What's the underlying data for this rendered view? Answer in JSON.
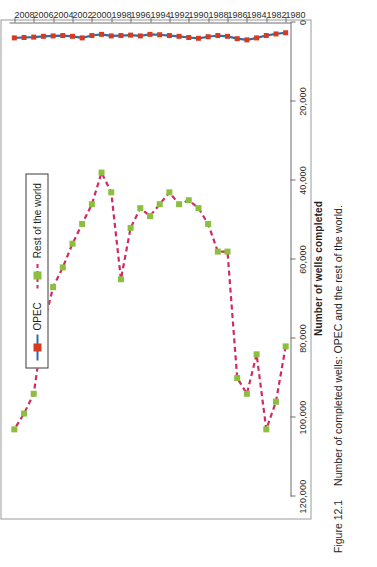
{
  "figure": {
    "number_label": "Figure 12.1",
    "caption": "Number of completed wells: OPEC and the rest of the world."
  },
  "legend": {
    "position": "upper-left-of-plot",
    "entries": [
      {
        "label": "OPEC",
        "line_color": "#2a6fa8",
        "marker_color": "#d83a20",
        "line_style": "solid"
      },
      {
        "label": "Rest of the world",
        "line_color": "#d12a63",
        "marker_color": "#8cbf3f",
        "line_style": "dashed"
      }
    ]
  },
  "chart_data": {
    "type": "line",
    "title": "",
    "subtitle": "",
    "xlabel": "",
    "ylabel": "Number of wells completed",
    "orientation": "rotated-90-ccw",
    "grid": false,
    "legend_position": "inside-upper-left",
    "xlim": [
      1979.5,
      2008.5
    ],
    "ylim": [
      0,
      120000
    ],
    "ytick_labels": [
      "0",
      "20,000",
      "40,000",
      "60,000",
      "80,000",
      "100,000",
      "120,000"
    ],
    "ytick_values": [
      0,
      20000,
      40000,
      60000,
      80000,
      100000,
      120000
    ],
    "xtick_labels": [
      "1980",
      "1982",
      "1984",
      "1986",
      "1988",
      "1990",
      "1992",
      "1994",
      "1996",
      "1998",
      "2000",
      "2002",
      "2004",
      "2006",
      "2008"
    ],
    "xtick_values": [
      1980,
      1982,
      1984,
      1986,
      1988,
      1990,
      1992,
      1994,
      1996,
      1998,
      2000,
      2002,
      2004,
      2006,
      2008
    ],
    "x": [
      1980,
      1981,
      1982,
      1983,
      1984,
      1985,
      1986,
      1987,
      1988,
      1989,
      1990,
      1991,
      1992,
      1993,
      1994,
      1995,
      1996,
      1997,
      1998,
      1999,
      2000,
      2001,
      2002,
      2003,
      2004,
      2005,
      2006,
      2007,
      2008
    ],
    "series": [
      {
        "name": "OPEC",
        "color": "#2a6fa8",
        "marker_color": "#d83a20",
        "line_style": "solid",
        "values": [
          2600,
          2900,
          3300,
          3900,
          4400,
          4100,
          3500,
          3300,
          3600,
          4000,
          3800,
          3500,
          3300,
          3100,
          3000,
          3400,
          3200,
          3300,
          3400,
          3000,
          3300,
          3900,
          3500,
          3300,
          3400,
          3500,
          3700,
          3800,
          3900
        ]
      },
      {
        "name": "Rest of the world",
        "color": "#d12a63",
        "marker_color": "#8cbf3f",
        "line_style": "dashed",
        "values": [
          82000,
          96000,
          103000,
          84000,
          94000,
          90000,
          58000,
          58000,
          51000,
          47000,
          45000,
          46000,
          43000,
          46000,
          49000,
          47000,
          52000,
          65000,
          43000,
          38000,
          46000,
          51000,
          56000,
          62000,
          67000,
          77000,
          94000,
          99000,
          103000
        ]
      }
    ]
  }
}
